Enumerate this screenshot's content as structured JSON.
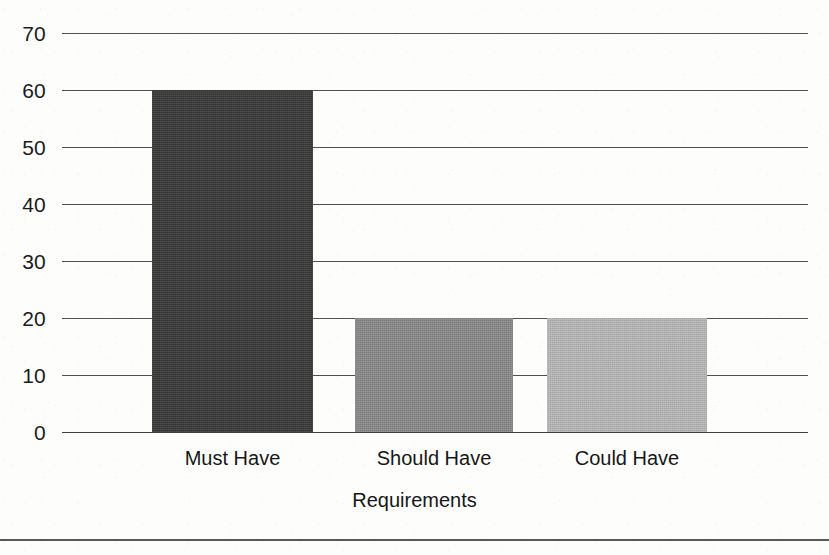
{
  "chart_data": {
    "type": "bar",
    "title": "",
    "subtitle": "",
    "xlabel": "Requirements",
    "ylabel": "",
    "categories": [
      "Must Have",
      "Should Have",
      "Could Have"
    ],
    "values": [
      60,
      20,
      20
    ],
    "ylim": [
      0,
      70
    ],
    "ytick_labels": [
      "0",
      "10",
      "20",
      "30",
      "40",
      "50",
      "60",
      "70"
    ],
    "ytick_values": [
      0,
      10,
      20,
      30,
      40,
      50,
      60,
      70
    ],
    "grid": true,
    "grid_axis": "y",
    "legend": false,
    "legend_position": "none",
    "bar_colors": [
      "#3a3a3a",
      "#8a8a8a",
      "#b8b8b8"
    ],
    "annotations": []
  },
  "figure": {
    "background_color": "#fdfdfc",
    "axis_color": "#2b2b2b",
    "text_color": "#171717",
    "bottom_rule": true
  }
}
